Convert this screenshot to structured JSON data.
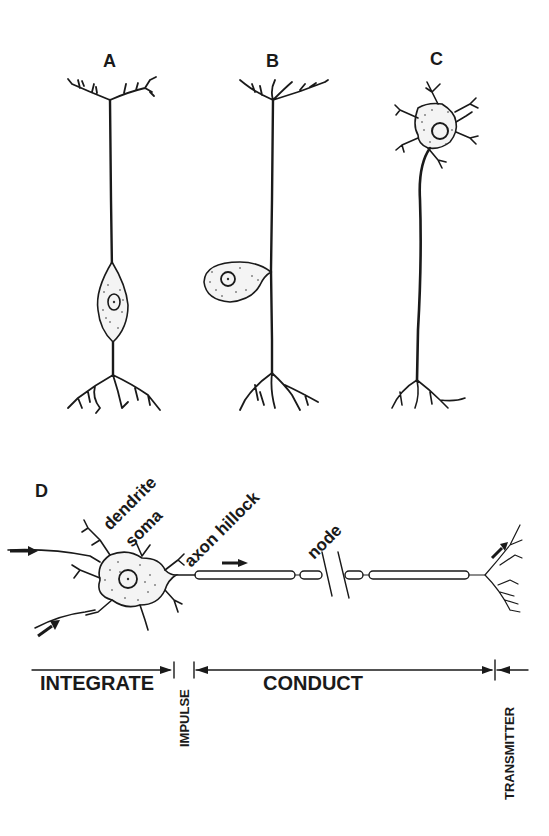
{
  "panels": {
    "a": {
      "label": "A"
    },
    "b": {
      "label": "B"
    },
    "c": {
      "label": "C"
    },
    "d": {
      "label": "D",
      "annotations": {
        "dendrite": "dendrite",
        "soma": "soma",
        "axon_hillock": "axon hillock",
        "node": "node"
      }
    }
  },
  "function_bar": {
    "integrate": "INTEGRATE",
    "impulse": "IMPULSE",
    "conduct": "CONDUCT",
    "transmitter": "TRANSMITTER"
  },
  "colors": {
    "ink": "#1a1a1a",
    "background": "#ffffff"
  }
}
